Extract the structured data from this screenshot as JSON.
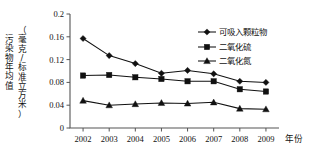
{
  "chart_data": {
    "type": "line",
    "title": "",
    "xlabel": "年份",
    "ylabel": "污染物年均值（毫克/标准立方米）",
    "ylabel_line1": "污染物年均值",
    "ylabel_line2": "（毫克/标准立方米）",
    "categories": [
      "2002",
      "2003",
      "2004",
      "2005",
      "2006",
      "2007",
      "2008",
      "2009"
    ],
    "x": [
      2002,
      2003,
      2004,
      2005,
      2006,
      2007,
      2008,
      2009
    ],
    "ylim": [
      0,
      0.2
    ],
    "yticks": [
      "0",
      "0.04",
      "0.08",
      "0.12",
      "0.16",
      "0.2"
    ],
    "ytick_values": [
      0,
      0.04,
      0.08,
      0.12,
      0.16,
      0.2
    ],
    "grid": false,
    "legend_position": "top-right",
    "series": [
      {
        "name": "可吸入颗粒物",
        "marker": "diamond",
        "color": "#111111",
        "values": [
          0.157,
          0.127,
          0.113,
          0.096,
          0.101,
          0.095,
          0.082,
          0.08
        ]
      },
      {
        "name": "二氧化硫",
        "marker": "square",
        "color": "#111111",
        "values": [
          0.092,
          0.093,
          0.089,
          0.086,
          0.082,
          0.082,
          0.068,
          0.064
        ]
      },
      {
        "name": "二氧化氮",
        "marker": "triangle",
        "color": "#111111",
        "values": [
          0.048,
          0.04,
          0.042,
          0.044,
          0.043,
          0.045,
          0.034,
          0.033
        ]
      }
    ]
  },
  "axes": {
    "x_axis_title": "年份",
    "y_axis_title_top": "污染物年均值",
    "y_axis_title_bottom": "（毫克/标准立方米）"
  },
  "legend": {
    "items": [
      {
        "label": "可吸入颗粒物",
        "marker": "diamond"
      },
      {
        "label": "二氧化硫",
        "marker": "square"
      },
      {
        "label": "二氧化氮",
        "marker": "triangle"
      }
    ]
  }
}
